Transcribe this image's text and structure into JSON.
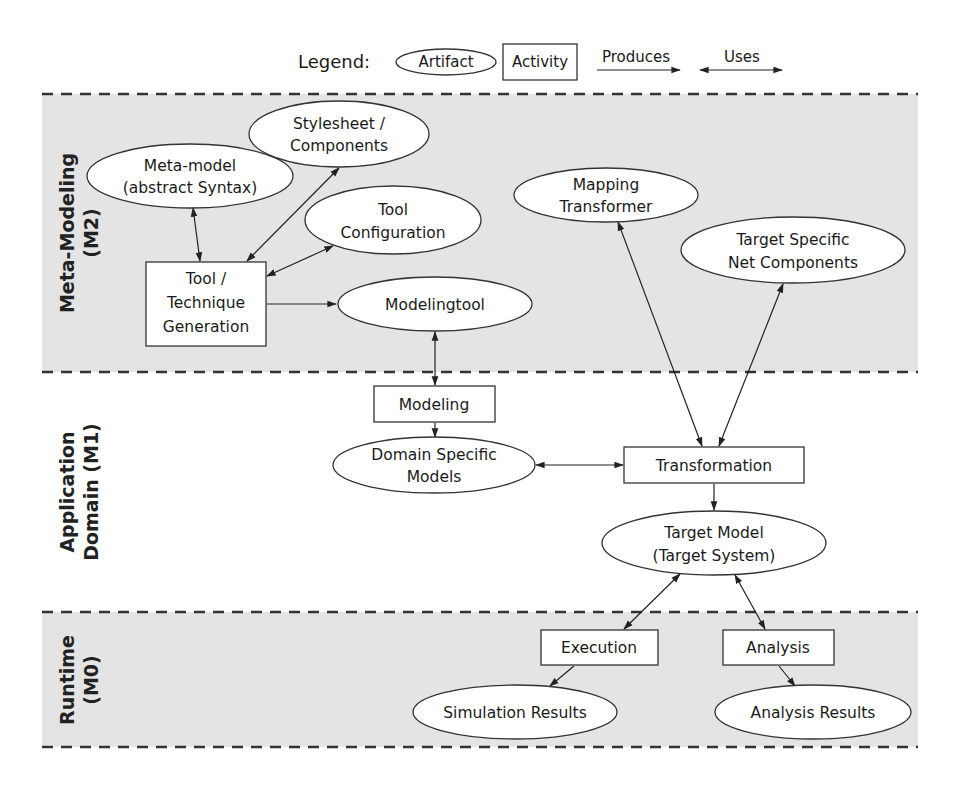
{
  "legend": {
    "title": "Legend:",
    "artifact": "Artifact",
    "activity": "Activity",
    "produces": "Produces",
    "uses": "Uses"
  },
  "bands": [
    {
      "id": "m2",
      "line1": "Meta-Modeling",
      "line2": "(M2)",
      "shaded": true
    },
    {
      "id": "m1",
      "line1": "Application",
      "line2": "Domain (M1)",
      "shaded": false
    },
    {
      "id": "m0",
      "line1": "Runtime",
      "line2": "(M0)",
      "shaded": true
    }
  ],
  "nodes": {
    "meta_model": {
      "type": "artifact",
      "lines": [
        "Meta-model",
        "(abstract Syntax)"
      ]
    },
    "stylesheet": {
      "type": "artifact",
      "lines": [
        "Stylesheet /",
        "Components"
      ]
    },
    "tool_configuration": {
      "type": "artifact",
      "lines": [
        "Tool",
        "Configuration"
      ]
    },
    "tool_generation": {
      "type": "activity",
      "lines": [
        "Tool /",
        "Technique",
        "Generation"
      ]
    },
    "modelingtool": {
      "type": "artifact",
      "lines": [
        "Modelingtool"
      ]
    },
    "mapping_transformer": {
      "type": "artifact",
      "lines": [
        "Mapping",
        "Transformer"
      ]
    },
    "target_net_components": {
      "type": "artifact",
      "lines": [
        "Target Specific",
        "Net Components"
      ]
    },
    "modeling": {
      "type": "activity",
      "lines": [
        "Modeling"
      ]
    },
    "domain_models": {
      "type": "artifact",
      "lines": [
        "Domain Specific",
        "Models"
      ]
    },
    "transformation": {
      "type": "activity",
      "lines": [
        "Transformation"
      ]
    },
    "target_model": {
      "type": "artifact",
      "lines": [
        "Target Model",
        "(Target System)"
      ]
    },
    "execution": {
      "type": "activity",
      "lines": [
        "Execution"
      ]
    },
    "analysis": {
      "type": "activity",
      "lines": [
        "Analysis"
      ]
    },
    "simulation_results": {
      "type": "artifact",
      "lines": [
        "Simulation Results"
      ]
    },
    "analysis_results": {
      "type": "artifact",
      "lines": [
        "Analysis Results"
      ]
    }
  },
  "edges": [
    {
      "from": "meta_model",
      "to": "tool_generation",
      "kind": "uses"
    },
    {
      "from": "stylesheet",
      "to": "tool_generation",
      "kind": "uses"
    },
    {
      "from": "tool_configuration",
      "to": "tool_generation",
      "kind": "uses"
    },
    {
      "from": "tool_generation",
      "to": "modelingtool",
      "kind": "produces"
    },
    {
      "from": "modelingtool",
      "to": "modeling",
      "kind": "uses"
    },
    {
      "from": "modeling",
      "to": "domain_models",
      "kind": "produces"
    },
    {
      "from": "domain_models",
      "to": "transformation",
      "kind": "uses"
    },
    {
      "from": "mapping_transformer",
      "to": "transformation",
      "kind": "uses"
    },
    {
      "from": "target_net_components",
      "to": "transformation",
      "kind": "uses"
    },
    {
      "from": "transformation",
      "to": "target_model",
      "kind": "produces"
    },
    {
      "from": "target_model",
      "to": "execution",
      "kind": "uses"
    },
    {
      "from": "target_model",
      "to": "analysis",
      "kind": "uses"
    },
    {
      "from": "execution",
      "to": "simulation_results",
      "kind": "produces"
    },
    {
      "from": "analysis",
      "to": "analysis_results",
      "kind": "produces"
    }
  ],
  "colors": {
    "band_shade": "#e4e4e4",
    "stroke": "#333333",
    "node_fill": "#ffffff"
  }
}
